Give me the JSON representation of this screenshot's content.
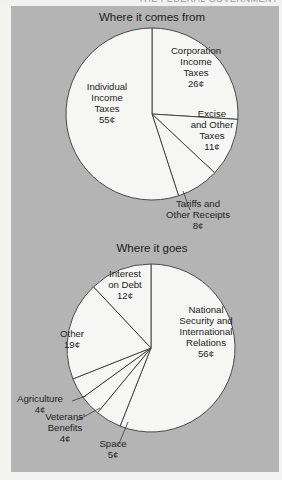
{
  "header_fragment": "THE FEDERAL GOVERNMENT",
  "colors": {
    "panel": "#b4b4b4",
    "slice_fill": "#f6f6f4",
    "slice_stroke": "#3a3a3a",
    "text": "#232323",
    "page": "#f4f4f3"
  },
  "chart_data": [
    {
      "type": "pie",
      "title": "Where it comes from",
      "unit": "¢ per dollar",
      "start_angle": "12 o'clock, clockwise",
      "categories": [
        "Corporation Income Taxes",
        "Excise and Other Taxes",
        "Tariffs and Other Receipts",
        "Individual Income Taxes"
      ],
      "values": [
        26,
        11,
        8,
        55
      ],
      "labels": [
        {
          "lines": [
            "Corporation",
            "Income",
            "Taxes",
            "26¢"
          ]
        },
        {
          "lines": [
            "Excise",
            "and Other",
            "Taxes",
            "11¢"
          ]
        },
        {
          "lines": [
            "Tariffs and",
            "Other Receipts",
            "8¢"
          ],
          "callout": true
        },
        {
          "lines": [
            "Individual",
            "Income",
            "Taxes",
            "55¢"
          ]
        }
      ]
    },
    {
      "type": "pie",
      "title": "Where it goes",
      "unit": "¢ per dollar",
      "start_angle": "12 o'clock, clockwise",
      "categories": [
        "National Security and International Relations",
        "Space",
        "Veterans' Benefits",
        "Agriculture",
        "Other",
        "Interest on Debt"
      ],
      "values": [
        56,
        5,
        4,
        4,
        19,
        12
      ],
      "labels": [
        {
          "lines": [
            "National",
            "Security and",
            "International",
            "Relations",
            "56¢"
          ]
        },
        {
          "lines": [
            "Space",
            "5¢"
          ],
          "callout": true
        },
        {
          "lines": [
            "Veterans'",
            "Benefits",
            "4¢"
          ],
          "callout": true
        },
        {
          "lines": [
            "Agriculture",
            "4¢"
          ],
          "callout": true
        },
        {
          "lines": [
            "Other",
            "19¢"
          ]
        },
        {
          "lines": [
            "Interest",
            "on Debt",
            "12¢"
          ]
        }
      ]
    }
  ]
}
